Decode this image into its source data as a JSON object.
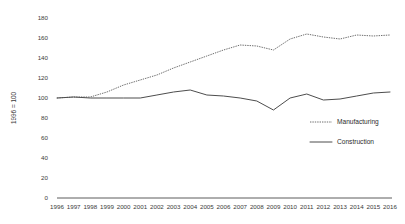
{
  "chart_data": {
    "type": "line",
    "title": "",
    "xlabel": "",
    "ylabel": "1996 = 100",
    "ylim": [
      0,
      180
    ],
    "ytick_step": 20,
    "yticks": [
      0,
      20,
      40,
      60,
      80,
      100,
      120,
      140,
      160,
      180
    ],
    "grid": false,
    "legend_position": "center-right",
    "categories": [
      "1996",
      "1997",
      "1998",
      "1999",
      "2000",
      "2001",
      "2002",
      "2003",
      "2004",
      "2005",
      "2006",
      "2007",
      "2008",
      "2009",
      "2010",
      "2011",
      "2012",
      "2013",
      "2014",
      "2015",
      "2016"
    ],
    "series": [
      {
        "name": "Manufacturing",
        "style": "dotted",
        "color": "#6e6e6e",
        "values": [
          100,
          101,
          101,
          106,
          113,
          118,
          123,
          130,
          136,
          142,
          148,
          153,
          152,
          148,
          159,
          164,
          161,
          159,
          163,
          162,
          163
        ]
      },
      {
        "name": "Construction",
        "style": "solid",
        "color": "#4d4d4d",
        "values": [
          100,
          101,
          100,
          100,
          100,
          100,
          103,
          106,
          108,
          103,
          102,
          100,
          97,
          88,
          100,
          104,
          98,
          99,
          102,
          105,
          106
        ]
      }
    ]
  },
  "axis": {
    "y_title": "1996 = 100"
  },
  "legend": {
    "items": [
      {
        "label": "Manufacturing",
        "style": "dotted"
      },
      {
        "label": "Construction",
        "style": "solid"
      }
    ]
  }
}
